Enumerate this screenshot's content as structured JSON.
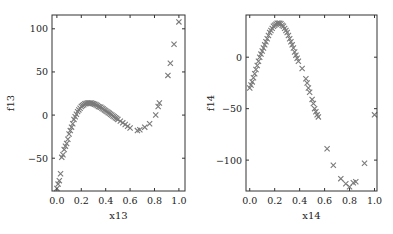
{
  "chart_data": [
    {
      "type": "scatter",
      "title": "",
      "xlabel": "x13",
      "ylabel": "f13",
      "xlim": [
        -0.04,
        1.05
      ],
      "ylim": [
        -88,
        116
      ],
      "xticks": [
        0.0,
        0.2,
        0.4,
        0.6,
        0.8,
        1.0
      ],
      "xtick_labels": [
        "0.0",
        "0.2",
        "0.4",
        "0.6",
        "0.8",
        "1.0"
      ],
      "yticks": [
        -50,
        0,
        50,
        100
      ],
      "ytick_labels": [
        "−50",
        "0",
        "50",
        "100"
      ],
      "marker": "x",
      "color": "#7a7a7a",
      "grid": false,
      "series": [
        {
          "name": "f13",
          "x": [
            0.0,
            0.01,
            0.02,
            0.03,
            0.04,
            0.05,
            0.06,
            0.07,
            0.08,
            0.09,
            0.1,
            0.11,
            0.12,
            0.13,
            0.14,
            0.15,
            0.16,
            0.17,
            0.18,
            0.19,
            0.2,
            0.21,
            0.22,
            0.23,
            0.24,
            0.25,
            0.26,
            0.27,
            0.28,
            0.29,
            0.3,
            0.31,
            0.32,
            0.33,
            0.34,
            0.35,
            0.36,
            0.37,
            0.38,
            0.39,
            0.4,
            0.41,
            0.42,
            0.43,
            0.44,
            0.45,
            0.46,
            0.47,
            0.48,
            0.49,
            0.5,
            0.52,
            0.54,
            0.56,
            0.58,
            0.6,
            0.66,
            0.68,
            0.72,
            0.76,
            0.81,
            0.83,
            0.84,
            0.91,
            0.93,
            0.96,
            1.0
          ],
          "y": [
            -85,
            -80,
            -76,
            -68,
            -49,
            -46,
            -40,
            -36,
            -33,
            -28,
            -22,
            -18,
            -14,
            -10,
            -5,
            -2,
            1,
            4,
            6,
            8,
            10,
            11,
            12,
            13,
            13.5,
            14,
            14,
            14,
            14,
            13.5,
            13,
            12.5,
            12,
            11,
            10,
            9.5,
            9,
            8,
            7,
            6,
            5,
            4,
            3,
            2,
            1,
            0,
            -1,
            -2,
            -3,
            -4,
            -5,
            -7,
            -9,
            -11,
            -13,
            -15,
            -18,
            -17,
            -14,
            -10,
            0,
            10,
            14,
            46,
            60,
            82,
            108
          ]
        }
      ]
    },
    {
      "type": "scatter",
      "title": "",
      "xlabel": "x14",
      "ylabel": "f14",
      "xlim": [
        -0.03,
        1.02
      ],
      "ylim": [
        -130,
        41
      ],
      "xticks": [
        0.0,
        0.2,
        0.4,
        0.6,
        0.8,
        1.0
      ],
      "xtick_labels": [
        "0.0",
        "0.2",
        "0.4",
        "0.6",
        "0.8",
        "1.0"
      ],
      "yticks": [
        -100,
        -50,
        0
      ],
      "ytick_labels": [
        "−100",
        "−50",
        "0"
      ],
      "marker": "x",
      "color": "#7a7a7a",
      "grid": false,
      "series": [
        {
          "name": "f14",
          "x": [
            0.0,
            0.01,
            0.02,
            0.03,
            0.04,
            0.05,
            0.06,
            0.07,
            0.08,
            0.09,
            0.1,
            0.11,
            0.12,
            0.13,
            0.14,
            0.15,
            0.16,
            0.17,
            0.18,
            0.19,
            0.2,
            0.21,
            0.22,
            0.23,
            0.24,
            0.25,
            0.26,
            0.27,
            0.28,
            0.29,
            0.3,
            0.31,
            0.32,
            0.33,
            0.34,
            0.35,
            0.36,
            0.37,
            0.38,
            0.39,
            0.42,
            0.45,
            0.46,
            0.47,
            0.48,
            0.5,
            0.51,
            0.52,
            0.53,
            0.54,
            0.55,
            0.62,
            0.67,
            0.73,
            0.77,
            0.8,
            0.83,
            0.85,
            0.92,
            1.0
          ],
          "y": [
            -30,
            -27,
            -24,
            -20,
            -16,
            -12,
            -8,
            -4,
            0,
            3,
            6,
            9,
            12,
            15,
            18,
            21,
            24,
            26,
            28,
            30,
            31,
            32,
            33,
            33,
            33,
            32.5,
            31,
            30,
            28,
            26,
            24,
            21,
            18,
            15,
            12,
            9,
            5,
            2,
            -1,
            -4,
            -11,
            -21,
            -25,
            -30,
            -34,
            -41,
            -45,
            -50,
            -53,
            -56,
            -58,
            -89,
            -105,
            -118,
            -123,
            -126,
            -122,
            -121,
            -103,
            -56
          ]
        }
      ]
    }
  ]
}
